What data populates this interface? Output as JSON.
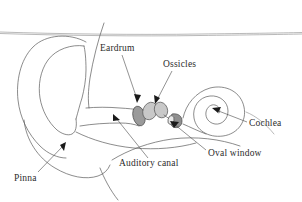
{
  "figure": {
    "background_color": "#ffffff",
    "line_color": "#5a5a5a",
    "text_color": "#2b2b2b",
    "width": 302,
    "height": 202
  },
  "labels": [
    {
      "key": "eardrum",
      "text": "Eardrum",
      "x": 100,
      "y": 49,
      "points_to": "tympanic-membrane"
    },
    {
      "key": "ossicles",
      "text": "Ossicles",
      "x": 163,
      "y": 65,
      "points_to": "ossicle-bones"
    },
    {
      "key": "cochlea",
      "text": "Cochlea",
      "x": 249,
      "y": 124,
      "points_to": "cochlea-spiral"
    },
    {
      "key": "oval_window",
      "text": "Oval window",
      "x": 208,
      "y": 154,
      "points_to": "oval-window-membrane"
    },
    {
      "key": "auditory_canal",
      "text": "Auditory canal",
      "x": 119,
      "y": 164,
      "points_to": "ear-canal"
    },
    {
      "key": "pinna",
      "text": "Pinna",
      "x": 14,
      "y": 179,
      "points_to": "outer-ear"
    }
  ],
  "structures": {
    "pinna": "outer ear flap, large curled outline on the left",
    "auditory_canal": "horizontal tube leading inward from the pinna",
    "eardrum": "shaded oval membrane at the inner end of the canal",
    "ossicles": "three small middle ear bones: malleus, incus, stapes",
    "oval_window": "small membrane between stapes and cochlea",
    "cochlea": "spiral shaped inner ear organ on the right",
    "head_outline": "faint horizontal contour line across the top"
  }
}
